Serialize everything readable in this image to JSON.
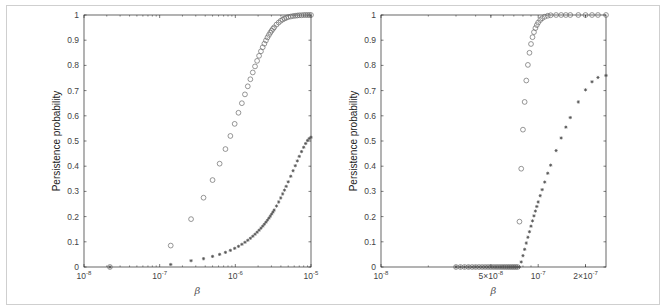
{
  "chart_data": [
    {
      "type": "scatter",
      "title": "",
      "xlabel": "β",
      "ylabel": "Persistence probability",
      "xscale": "log",
      "xlim": [
        1e-08,
        1e-05
      ],
      "ylim": [
        0,
        1
      ],
      "xticks": [
        1e-08,
        1e-07,
        1e-06,
        1e-05
      ],
      "xtick_labels": [
        "10^-8",
        "10^-7",
        "10^-6",
        "10^-5"
      ],
      "yticks": [
        0,
        0.1,
        0.2,
        0.3,
        0.4,
        0.5,
        0.6,
        0.7,
        0.8,
        0.9,
        1
      ],
      "ytick_labels": [
        "0",
        "0.1",
        "0.2",
        "0.3",
        "0.4",
        "0.5",
        "0.6",
        "0.7",
        "0.8",
        "0.9",
        "1"
      ],
      "grid": false,
      "legend": null,
      "series": [
        {
          "name": "circles",
          "marker": "o",
          "x": [
            2.2e-08,
            1.4e-07,
            2.6e-07,
            3.8e-07,
            5e-07,
            6.2e-07,
            7.4e-07,
            8.6e-07,
            9.8e-07,
            1.1e-06,
            1.22e-06,
            1.34e-06,
            1.46e-06,
            1.58e-06,
            1.7e-06,
            1.82e-06,
            1.94e-06,
            2.06e-06,
            2.18e-06,
            2.3e-06,
            2.42e-06,
            2.54e-06,
            2.66e-06,
            2.78e-06,
            2.9e-06,
            3.02e-06,
            3.14e-06,
            3.26e-06,
            3.5e-06,
            3.74e-06,
            3.98e-06,
            4.22e-06,
            4.46e-06,
            4.7e-06,
            5e-06,
            5.4e-06,
            5.8e-06,
            6.2e-06,
            6.6e-06,
            7e-06,
            7.5e-06,
            8e-06,
            8.5e-06,
            9e-06,
            9.5e-06,
            1e-05
          ],
          "y": [
            0,
            0.085,
            0.19,
            0.275,
            0.345,
            0.41,
            0.468,
            0.52,
            0.568,
            0.612,
            0.65,
            0.685,
            0.717,
            0.745,
            0.772,
            0.796,
            0.818,
            0.838,
            0.856,
            0.872,
            0.886,
            0.899,
            0.911,
            0.921,
            0.93,
            0.938,
            0.945,
            0.951,
            0.962,
            0.97,
            0.977,
            0.982,
            0.986,
            0.989,
            0.992,
            0.994,
            0.996,
            0.997,
            0.998,
            0.999,
            0.999,
            1.0,
            1.0,
            1.0,
            1.0,
            1.0
          ]
        },
        {
          "name": "stars",
          "marker": "*",
          "x": [
            2.2e-08,
            1.4e-07,
            2.6e-07,
            3.8e-07,
            5e-07,
            6.2e-07,
            7.4e-07,
            8.6e-07,
            9.8e-07,
            1.1e-06,
            1.22e-06,
            1.34e-06,
            1.46e-06,
            1.58e-06,
            1.7e-06,
            1.82e-06,
            1.94e-06,
            2.06e-06,
            2.18e-06,
            2.3e-06,
            2.42e-06,
            2.54e-06,
            2.66e-06,
            2.78e-06,
            2.9e-06,
            3.02e-06,
            3.14e-06,
            3.26e-06,
            3.5e-06,
            3.74e-06,
            3.98e-06,
            4.22e-06,
            4.46e-06,
            4.7e-06,
            5e-06,
            5.4e-06,
            5.8e-06,
            6.2e-06,
            6.6e-06,
            7e-06,
            7.5e-06,
            8e-06,
            8.5e-06,
            9e-06,
            9.5e-06,
            1e-05
          ],
          "y": [
            0,
            0.01,
            0.025,
            0.033,
            0.042,
            0.05,
            0.058,
            0.066,
            0.074,
            0.082,
            0.09,
            0.098,
            0.106,
            0.114,
            0.122,
            0.13,
            0.138,
            0.146,
            0.154,
            0.162,
            0.17,
            0.178,
            0.186,
            0.194,
            0.202,
            0.21,
            0.218,
            0.226,
            0.242,
            0.258,
            0.274,
            0.29,
            0.305,
            0.32,
            0.338,
            0.36,
            0.382,
            0.402,
            0.421,
            0.439,
            0.458,
            0.475,
            0.49,
            0.502,
            0.51,
            0.515
          ]
        }
      ]
    },
    {
      "type": "scatter",
      "title": "",
      "xlabel": "β",
      "ylabel": "Persistence probability",
      "xscale": "log",
      "xlim": [
        1e-08,
        2.7e-07
      ],
      "ylim": [
        0,
        1
      ],
      "xticks": [
        1e-08,
        5e-08,
        1e-07,
        2e-07
      ],
      "xtick_labels": [
        "10^-8",
        "5×10^-8",
        "10^-7",
        "2×10^-7"
      ],
      "yticks": [
        0,
        0.1,
        0.2,
        0.3,
        0.4,
        0.5,
        0.6,
        0.7,
        0.8,
        0.9,
        1
      ],
      "ytick_labels": [
        "0",
        "0.1",
        "0.2",
        "0.3",
        "0.4",
        "0.5",
        "0.6",
        "0.7",
        "0.8",
        "0.9",
        "1"
      ],
      "grid": false,
      "legend": null,
      "series": [
        {
          "name": "circles",
          "marker": "o",
          "x": [
            3e-08,
            3.2e-08,
            3.4e-08,
            3.6e-08,
            3.8e-08,
            4e-08,
            4.2e-08,
            4.4e-08,
            4.6e-08,
            4.8e-08,
            5e-08,
            5.2e-08,
            5.4e-08,
            5.6e-08,
            5.8e-08,
            6e-08,
            6.2e-08,
            6.4e-08,
            6.6e-08,
            6.8e-08,
            7e-08,
            7.2e-08,
            7.4e-08,
            7.6e-08,
            7.8e-08,
            8e-08,
            8.2e-08,
            8.4e-08,
            8.6e-08,
            8.8e-08,
            9e-08,
            9.2e-08,
            9.4e-08,
            9.6e-08,
            9.8e-08,
            1e-07,
            1.03e-07,
            1.06e-07,
            1.1e-07,
            1.15e-07,
            1.2e-07,
            1.3e-07,
            1.4e-07,
            1.5e-07,
            1.6e-07,
            1.8e-07,
            2e-07,
            2.2e-07,
            2.4e-07,
            2.7e-07
          ],
          "y": [
            0,
            0,
            0,
            0,
            0,
            0,
            0,
            0,
            0,
            0,
            0,
            0,
            0,
            0,
            0,
            0,
            0,
            0,
            0,
            0,
            0,
            0,
            0,
            0.18,
            0.39,
            0.545,
            0.655,
            0.74,
            0.802,
            0.85,
            0.885,
            0.912,
            0.932,
            0.948,
            0.96,
            0.97,
            0.98,
            0.987,
            0.993,
            0.997,
            0.999,
            1.0,
            1.0,
            1.0,
            1.0,
            1.0,
            1.0,
            1.0,
            1.0,
            1.0
          ]
        },
        {
          "name": "stars",
          "marker": "*",
          "x": [
            3e-08,
            3.2e-08,
            3.4e-08,
            3.6e-08,
            3.8e-08,
            4e-08,
            4.2e-08,
            4.4e-08,
            4.6e-08,
            4.8e-08,
            5e-08,
            5.2e-08,
            5.4e-08,
            5.6e-08,
            5.8e-08,
            6e-08,
            6.2e-08,
            6.4e-08,
            6.6e-08,
            6.8e-08,
            7e-08,
            7.2e-08,
            7.4e-08,
            7.6e-08,
            7.8e-08,
            8e-08,
            8.2e-08,
            8.4e-08,
            8.6e-08,
            8.8e-08,
            9e-08,
            9.2e-08,
            9.4e-08,
            9.6e-08,
            9.8e-08,
            1e-07,
            1.03e-07,
            1.06e-07,
            1.1e-07,
            1.15e-07,
            1.2e-07,
            1.3e-07,
            1.4e-07,
            1.5e-07,
            1.6e-07,
            1.8e-07,
            2e-07,
            2.2e-07,
            2.4e-07,
            2.7e-07
          ],
          "y": [
            0,
            0,
            0,
            0,
            0,
            0,
            0,
            0,
            0,
            0,
            0,
            0,
            0,
            0,
            0,
            0,
            0,
            0,
            0,
            0,
            0,
            0,
            0,
            0,
            0.02,
            0.045,
            0.07,
            0.095,
            0.118,
            0.14,
            0.162,
            0.183,
            0.203,
            0.222,
            0.24,
            0.258,
            0.283,
            0.307,
            0.337,
            0.372,
            0.404,
            0.462,
            0.512,
            0.555,
            0.593,
            0.655,
            0.703,
            0.735,
            0.752,
            0.76
          ]
        }
      ]
    }
  ]
}
